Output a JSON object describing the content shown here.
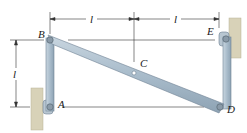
{
  "diagram": {
    "points": {
      "A": "A",
      "B": "B",
      "C": "C",
      "D": "D",
      "E": "E"
    },
    "dimensions": {
      "top_left": "l",
      "top_right": "l",
      "vertical": "l"
    },
    "colors": {
      "bar_fill": "#a9bccb",
      "bar_edge": "#6f8294",
      "wall": "#d8d2b8",
      "pin": "#8a9aa8",
      "dim_line": "#333333"
    }
  }
}
